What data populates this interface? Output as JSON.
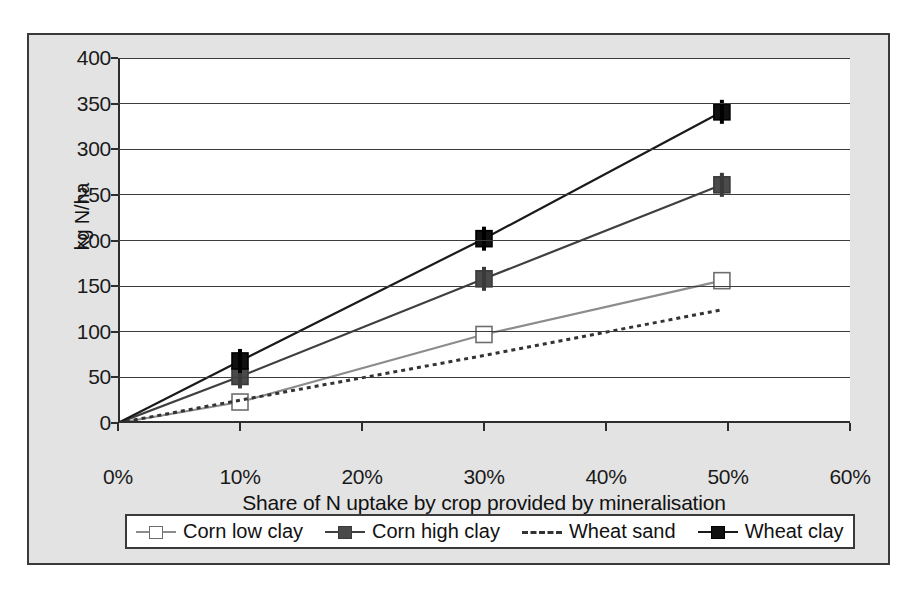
{
  "chart_data": {
    "type": "line",
    "title": "",
    "subtitle": "",
    "xlabel": "Share of N uptake by crop provided by mineralisation",
    "ylabel": "kg N/ha",
    "xlim": [
      0,
      60
    ],
    "ylim": [
      0,
      400
    ],
    "xtick_labels": [
      "0%",
      "10%",
      "20%",
      "30%",
      "40%",
      "50%",
      "60%"
    ],
    "xtick_values": [
      0,
      10,
      20,
      30,
      40,
      50,
      60
    ],
    "ytick_labels": [
      "0",
      "50",
      "100",
      "150",
      "200",
      "250",
      "300",
      "350",
      "400"
    ],
    "ytick_values": [
      0,
      50,
      100,
      150,
      200,
      250,
      300,
      350,
      400
    ],
    "grid": "horizontal",
    "legend_position": "below-plot",
    "x": [
      0,
      10,
      30,
      49.5
    ],
    "series": [
      {
        "name": "Corn low clay",
        "values": [
          0,
          23,
          97,
          156
        ],
        "marker": "open-square",
        "line_style": "solid",
        "color": "#8c8c8c",
        "marker_fill": "#ffffff",
        "marker_edge": "#6e6e6e"
      },
      {
        "name": "Corn high clay",
        "values": [
          0,
          51,
          158,
          261
        ],
        "marker": "filled-square",
        "line_style": "solid",
        "color": "#3f3f3f",
        "marker_fill": "#4a4a4a",
        "marker_edge": "#3a3a3a"
      },
      {
        "name": "Wheat sand",
        "values": [
          0,
          25,
          74,
          124
        ],
        "marker": "none",
        "line_style": "dashed",
        "color": "#333333",
        "marker_fill": "none",
        "marker_edge": "none"
      },
      {
        "name": "Wheat clay",
        "values": [
          0,
          68,
          202,
          341
        ],
        "marker": "filled-square",
        "line_style": "solid",
        "color": "#1a1a1a",
        "marker_fill": "#111111",
        "marker_edge": "#000000"
      }
    ]
  },
  "legend": {
    "items": [
      {
        "label": "Corn low clay"
      },
      {
        "label": "Corn high clay"
      },
      {
        "label": "Wheat sand"
      },
      {
        "label": "Wheat clay"
      }
    ]
  },
  "colors": {
    "frame_background": "#e3e3e3",
    "plot_background": "#ffffff",
    "border": "#3a3a3a",
    "gridline": "#3c3c3c",
    "axis": "#2d2d2d"
  }
}
